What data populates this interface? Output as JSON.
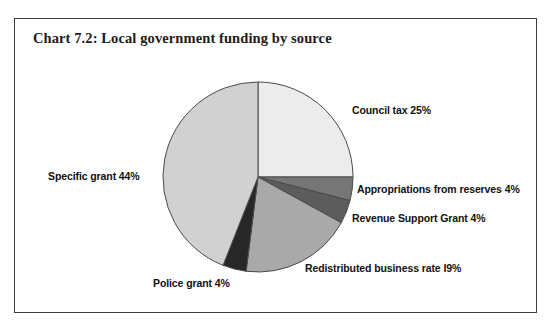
{
  "figure": {
    "title": "Chart 7.2: Local government funding by source",
    "border_color": "#3d3d3d",
    "background": "#ffffff"
  },
  "chart_data": {
    "type": "pie",
    "title": "Chart 7.2: Local government funding by source",
    "xlabel": "",
    "ylabel": "",
    "legend_position": "none",
    "grid": false,
    "start_angle_deg": 0,
    "direction": "clockwise",
    "categories": [
      "Council tax",
      "Appropriations from reserves",
      "Revenue Support Grant",
      "Redistributed business rate",
      "Police grant",
      "Specific grant"
    ],
    "values": [
      25,
      4,
      4,
      19,
      4,
      44
    ],
    "units": "percent",
    "colors": [
      "#ececec",
      "#767676",
      "#5c5c5c",
      "#a9a9a9",
      "#272727",
      "#d1d1d1"
    ],
    "labels": [
      "Council tax 25%",
      "Appropriations from reserves 4%",
      "Revenue Support Grant 4%",
      "Redistributed business rate I9%",
      "Police grant 4%",
      "Specific grant 44%"
    ],
    "slice_edge_color": "#4a4a4a",
    "center": [
      258,
      177
    ],
    "radius": 95
  }
}
